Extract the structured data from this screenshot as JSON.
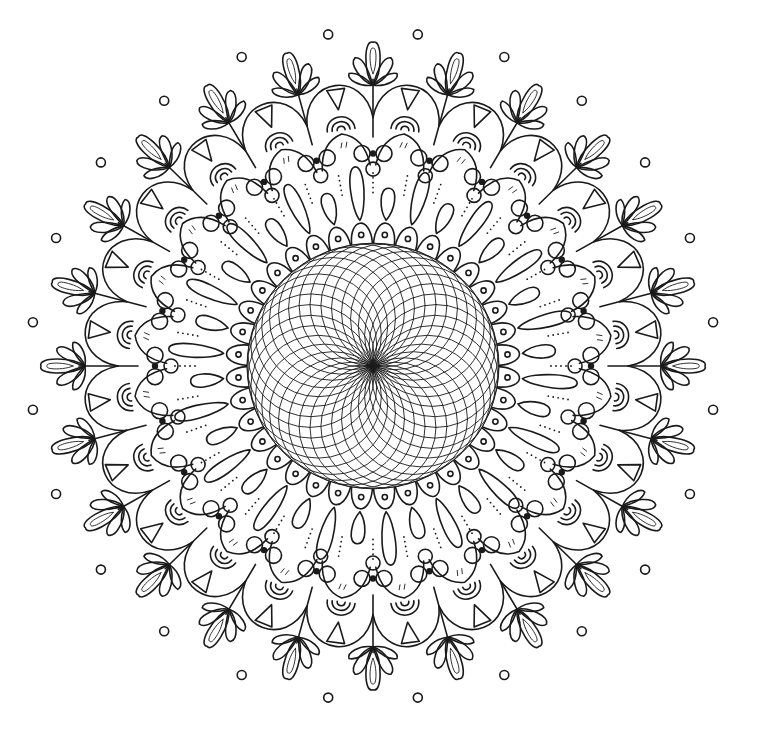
{
  "artwork": {
    "type": "mandala-coloring-page",
    "background": "#ffffff",
    "ink_color": "#1a1a1a",
    "center": {
      "x": 373,
      "y": 366
    },
    "scale_x": 1.0,
    "scale_y": 0.975,
    "rings": {
      "spirograph": {
        "circles": 36,
        "radius": 63
      },
      "inner_scallops": {
        "count": 36,
        "r_inner": 126,
        "r_outer": 150
      },
      "teardrops": {
        "count": 36,
        "r_inner": 150,
        "r_outer": 205
      },
      "beads": {
        "count": 24,
        "r": 218
      },
      "pointed_petals": {
        "count": 24,
        "r_inner": 205,
        "r_outer": 240
      },
      "arches": {
        "count": 24,
        "r": 250
      },
      "triangle_cells": {
        "count": 24,
        "r_inner": 255,
        "r_outer": 292
      },
      "trefoil_leaves": {
        "count": 24,
        "r_inner": 288,
        "r_outer": 332
      },
      "outer_dots": {
        "count": 24,
        "r": 343
      }
    }
  }
}
